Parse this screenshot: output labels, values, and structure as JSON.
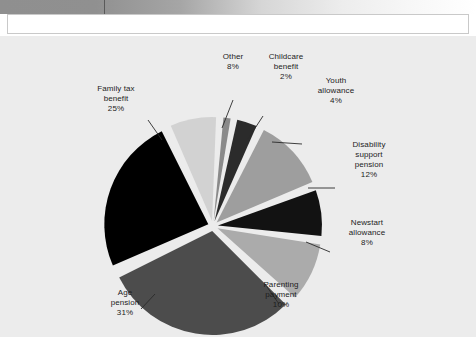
{
  "document": {
    "top_bar": {
      "name": "gradient-rule",
      "tick_position_px": 104
    },
    "header_panel": {
      "content": ""
    }
  },
  "chart_data": {
    "type": "pie",
    "title": "",
    "subtitle": "",
    "xlabel": "",
    "ylabel": "",
    "legend_position": "callout-labels",
    "grid": false,
    "exploded": true,
    "units": "percent",
    "categories": [
      "Family tax benefit",
      "Other",
      "Childcare benefit",
      "Youth allowance",
      "Disability support pension",
      "Newstart allowance",
      "Parenting payment",
      "Age pension"
    ],
    "values": [
      25,
      8,
      2,
      4,
      12,
      8,
      10,
      31
    ],
    "slices": [
      {
        "label": "Family tax benefit",
        "label_lines": "Family tax\nbenefit",
        "value": 25,
        "value_text": "25%",
        "color": "#000000",
        "start_angle": 245,
        "end_angle": 335
      },
      {
        "label": "Other",
        "label_lines": "Other",
        "value": 8,
        "value_text": "8%",
        "color": "#d2d2d2",
        "start_angle": 335,
        "end_angle": 363.8
      },
      {
        "label": "Childcare benefit",
        "label_lines": "Childcare\nbenefit",
        "value": 2,
        "value_text": "2%",
        "color": "#8a8a8a",
        "start_angle": 363.8,
        "end_angle": 371
      },
      {
        "label": "Youth allowance",
        "label_lines": "Youth\nallowance",
        "value": 4,
        "value_text": "4%",
        "color": "#2b2b2b",
        "start_angle": 371,
        "end_angle": 385.4
      },
      {
        "label": "Disability support pension",
        "label_lines": "Disability\nsupport\npension",
        "value": 12,
        "value_text": "12%",
        "color": "#9e9e9e",
        "start_angle": 385.4,
        "end_angle": 428.6
      },
      {
        "label": "Newstart allowance",
        "label_lines": "Newstart\nallowance",
        "value": 8,
        "value_text": "8%",
        "color": "#121212",
        "start_angle": 428.6,
        "end_angle": 457.4
      },
      {
        "label": "Parenting payment",
        "label_lines": "Parenting\npayment",
        "value": 10,
        "value_text": "10%",
        "color": "#ababab",
        "start_angle": 457.4,
        "end_angle": 493.4
      },
      {
        "label": "Age pension",
        "label_lines": "Age\npension",
        "value": 31,
        "value_text": "31%",
        "color": "#4c4c4c",
        "start_angle": 493.4,
        "end_angle": 605
      }
    ],
    "colors": {
      "background": "#ececec",
      "slice_gap": "#ececec",
      "label_text": "#1c1c1c",
      "leader_line": "#2a2a2a"
    },
    "geometry": {
      "center_x": 213,
      "center_y": 190,
      "radius": 104,
      "explode_offset": 5
    }
  },
  "labels": {
    "family_tax_benefit": {
      "text": "Family tax\nbenefit",
      "pct": "25%"
    },
    "other": {
      "text": "Other",
      "pct": "8%"
    },
    "childcare_benefit": {
      "text": "Childcare\nbenefit",
      "pct": "2%"
    },
    "youth_allowance": {
      "text": "Youth\nallowance",
      "pct": "4%"
    },
    "disability_support_pension": {
      "text": "Disability\nsupport\npension",
      "pct": "12%"
    },
    "newstart_allowance": {
      "text": "Newstart\nallowance",
      "pct": "8%"
    },
    "parenting_payment": {
      "text": "Parenting\npayment",
      "pct": "10%"
    },
    "age_pension": {
      "text": "Age\npension",
      "pct": "31%"
    }
  }
}
